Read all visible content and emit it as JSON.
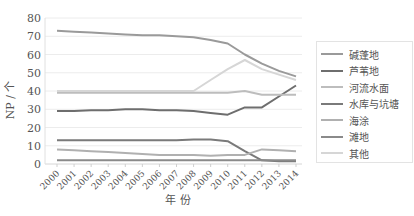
{
  "chart_data": {
    "type": "line",
    "title": "",
    "xlabel": "年 份",
    "ylabel": "NP / 个",
    "ylim": [
      0,
      80
    ],
    "yticks": [
      0,
      10,
      20,
      30,
      40,
      50,
      60,
      70,
      80
    ],
    "grid": true,
    "legend_position": "right",
    "x": [
      "2000",
      "2001",
      "2002",
      "2003",
      "2004",
      "2005",
      "2006",
      "2007",
      "2008",
      "2009",
      "2010",
      "2011",
      "2012",
      "2013",
      "2014"
    ],
    "series": [
      {
        "name": "碱蓬地",
        "color": "#9a9a9a",
        "values": [
          73,
          72.5,
          72,
          71.5,
          71,
          70.5,
          70.5,
          70,
          69.5,
          68,
          66,
          60,
          55,
          51,
          48
        ]
      },
      {
        "name": "芦苇地",
        "color": "#6e6e6e",
        "values": [
          29,
          29,
          29.5,
          29.5,
          30,
          30,
          29.5,
          29.5,
          29,
          28,
          27,
          31,
          31,
          37,
          43
        ]
      },
      {
        "name": "河流水面",
        "color": "#bdbdbd",
        "values": [
          39,
          39,
          39,
          39,
          39,
          39,
          39,
          39,
          39,
          39,
          39,
          40,
          38,
          38,
          38
        ]
      },
      {
        "name": "水库与坑塘",
        "color": "#7a7a7a",
        "values": [
          13,
          13,
          13,
          13,
          13,
          13,
          13,
          13,
          13.5,
          13.5,
          12.5,
          7,
          2,
          1.5,
          1.5
        ]
      },
      {
        "name": "海涂",
        "color": "#b0b0b0",
        "values": [
          8,
          7.5,
          7,
          6.5,
          6,
          5.5,
          5,
          5,
          5,
          4.5,
          5,
          5,
          8,
          7.5,
          7
        ]
      },
      {
        "name": "滩地",
        "color": "#8a8a8a",
        "values": [
          2,
          2,
          2,
          2,
          2,
          2,
          2,
          2,
          2,
          2,
          2,
          2,
          2,
          2,
          2
        ]
      },
      {
        "name": "其他",
        "color": "#d6d6d6",
        "values": [
          40,
          40,
          40,
          40,
          40,
          40,
          40,
          40,
          40,
          46,
          52,
          57,
          52,
          49,
          46
        ]
      }
    ]
  },
  "legend": {
    "items": [
      {
        "label": "碱蓬地"
      },
      {
        "label": "芦苇地"
      },
      {
        "label": "河流水面"
      },
      {
        "label": "水库与坑塘"
      },
      {
        "label": "海涂"
      },
      {
        "label": "滩地"
      },
      {
        "label": "其他"
      }
    ]
  }
}
